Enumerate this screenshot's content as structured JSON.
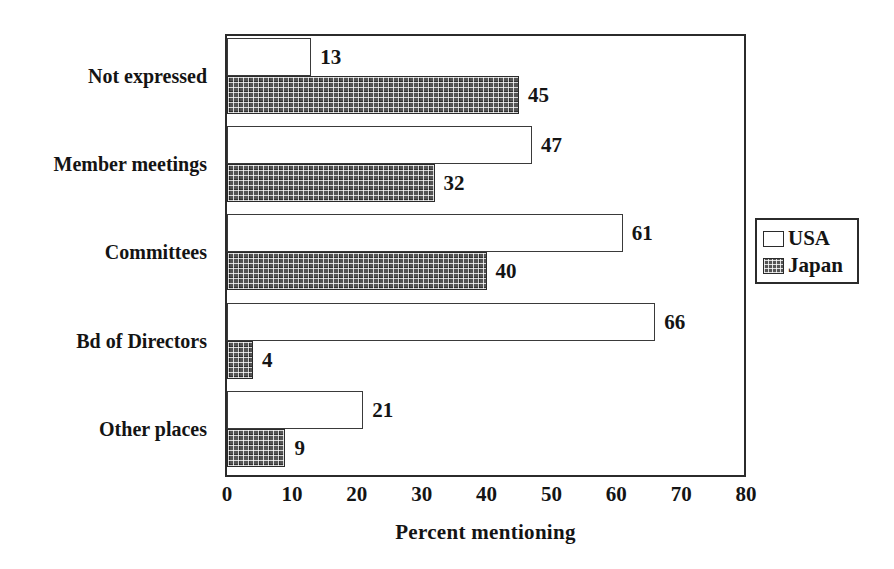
{
  "chart_data": {
    "type": "bar",
    "orientation": "horizontal",
    "title": "",
    "subtitle": "",
    "xlabel": "Percent mentioning",
    "ylabel": "",
    "xlim": [
      0,
      80
    ],
    "xticks": [
      "0",
      "10",
      "20",
      "30",
      "40",
      "50",
      "60",
      "70",
      "80"
    ],
    "grid": false,
    "legend_position": "right-outside",
    "categories": [
      "Not expressed",
      "Member meetings",
      "Committees",
      "Bd of Directors",
      "Other places"
    ],
    "series": [
      {
        "name": "USA",
        "fill": "white",
        "values": [
          13,
          47,
          61,
          66,
          21
        ],
        "labels": [
          "13",
          "47",
          "61",
          "66",
          "21"
        ]
      },
      {
        "name": "Japan",
        "fill": "dark-crosshatch",
        "values": [
          45,
          32,
          40,
          4,
          9
        ],
        "labels": [
          "45",
          "32",
          "40",
          "4",
          "9"
        ]
      }
    ]
  },
  "legend": {
    "entries": [
      {
        "label": "USA",
        "swatch": "white-square-icon"
      },
      {
        "label": "Japan",
        "swatch": "hatched-square-icon"
      }
    ]
  },
  "colors": {
    "frame": "#2b2b2b",
    "text": "#141414",
    "usa_fill": "#ffffff",
    "usa_stroke": "#3a3a3a",
    "japan_fill": "#545454",
    "japan_stroke": "#2a2a2a",
    "background": "#ffffff"
  }
}
